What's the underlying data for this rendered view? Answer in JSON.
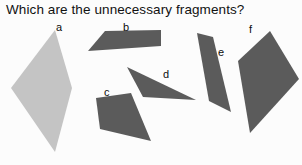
{
  "prompt": {
    "question": "Which are the unnecessary fragments?"
  },
  "colors": {
    "background": "#fcfcfc",
    "text": "#111111",
    "shape_light": "#c4c4c4",
    "shape_dark": "#5b5b5b"
  },
  "figure": {
    "width": 302,
    "height": 165,
    "shapes": [
      {
        "id": "a",
        "label": "a",
        "kind": "rhombus",
        "fill": "#c4c4c4",
        "points": "55,30 72,88 55,152 11,88",
        "label_x": 56,
        "label_y": 22
      },
      {
        "id": "b",
        "label": "b",
        "kind": "quadrilateral",
        "fill": "#5b5b5b",
        "points": "105,31 161,30 161,46 88,51",
        "label_x": 123,
        "label_y": 22
      },
      {
        "id": "c",
        "label": "c",
        "kind": "quadrilateral",
        "fill": "#5b5b5b",
        "points": "96,98 131,93 151,141 100,129",
        "label_x": 104,
        "label_y": 87
      },
      {
        "id": "d",
        "label": "d",
        "kind": "sliver-triangle",
        "fill": "#5b5b5b",
        "points": "127,67 196,100 143,97",
        "label_x": 163,
        "label_y": 69
      },
      {
        "id": "e",
        "label": "e",
        "kind": "narrow-parallelogram",
        "fill": "#5b5b5b",
        "points": "197,33 213,37 231,112 209,101",
        "label_x": 218,
        "label_y": 47
      },
      {
        "id": "f",
        "label": "f",
        "kind": "quadrilateral",
        "fill": "#5b5b5b",
        "points": "270,31 299,79 250,133 238,61",
        "label_x": 249,
        "label_y": 24
      }
    ]
  }
}
